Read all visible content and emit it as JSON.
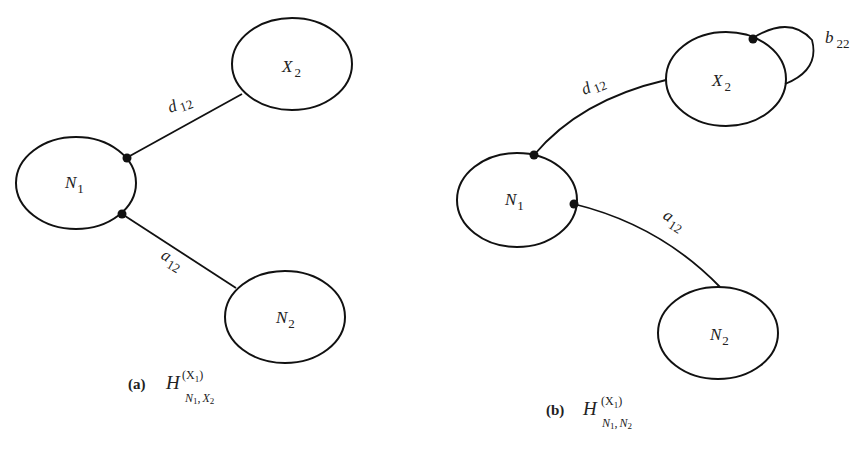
{
  "panels": [
    {
      "id": "a",
      "caption": {
        "tag": "(a)",
        "symbol": "H",
        "superscript": "(X",
        "superscript_sub": "1",
        "superscript_close": ")",
        "subscript_a": "N",
        "subscript_a_sub": "1",
        "subscript_sep": ",",
        "subscript_b": "X",
        "subscript_b_sub": "2"
      },
      "nodes": [
        {
          "id": "X2",
          "label": "X",
          "sub": "2"
        },
        {
          "id": "N1",
          "label": "N",
          "sub": "1"
        },
        {
          "id": "N2",
          "label": "N",
          "sub": "2"
        }
      ],
      "edges": [
        {
          "from": "N1",
          "to": "X2",
          "label": "d",
          "sub": "12"
        },
        {
          "from": "N1",
          "to": "N2",
          "label": "a",
          "sub": "12"
        }
      ]
    },
    {
      "id": "b",
      "caption": {
        "tag": "(b)",
        "symbol": "H",
        "superscript": "(X",
        "superscript_sub": "1",
        "superscript_close": ")",
        "subscript_a": "N",
        "subscript_a_sub": "1",
        "subscript_sep": ",",
        "subscript_b": "N",
        "subscript_b_sub": "2"
      },
      "nodes": [
        {
          "id": "X2",
          "label": "X",
          "sub": "2"
        },
        {
          "id": "N1",
          "label": "N",
          "sub": "1"
        },
        {
          "id": "N2",
          "label": "N",
          "sub": "2"
        }
      ],
      "edges": [
        {
          "from": "N1",
          "to": "X2",
          "label": "d",
          "sub": "12"
        },
        {
          "from": "N1",
          "to": "N2",
          "label": "a",
          "sub": "12"
        },
        {
          "from": "X2",
          "to": "X2",
          "label": "b",
          "sub": "22"
        }
      ]
    }
  ]
}
